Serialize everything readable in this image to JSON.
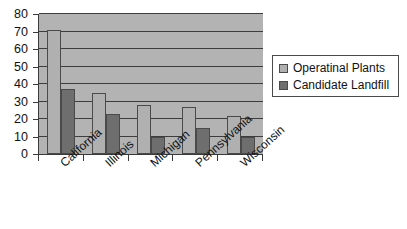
{
  "chart_data": {
    "type": "bar",
    "title": "",
    "subtitle": "",
    "xlabel": "",
    "ylabel": "",
    "ylim": [
      0,
      80
    ],
    "yticks": [
      0,
      10,
      20,
      30,
      40,
      50,
      60,
      70,
      80
    ],
    "ytick_labels": [
      "0",
      "10",
      "20",
      "30",
      "40",
      "50",
      "60",
      "70",
      "80"
    ],
    "grid": true,
    "grid_axis": "y",
    "legend_position": "right",
    "categories": [
      "California",
      "Illinois",
      "Michigan",
      "Pennsylvania",
      "Wisconsin"
    ],
    "series": [
      {
        "name": "Operatinal Plants",
        "color": "#b0b0b0",
        "values": [
          71,
          35,
          28,
          27,
          22
        ]
      },
      {
        "name": "Candidate Landfill",
        "color": "#6e6e6e",
        "values": [
          37,
          23,
          10,
          15,
          10
        ]
      }
    ],
    "colors": {
      "plot_background": "#b3b3b3",
      "axis": "#3a3a3a",
      "gridline": "#3d3d3d",
      "figure_background": "#ffffff",
      "text": "#111111",
      "series_0": "#b0b0b0",
      "series_1": "#6e6e6e"
    }
  }
}
